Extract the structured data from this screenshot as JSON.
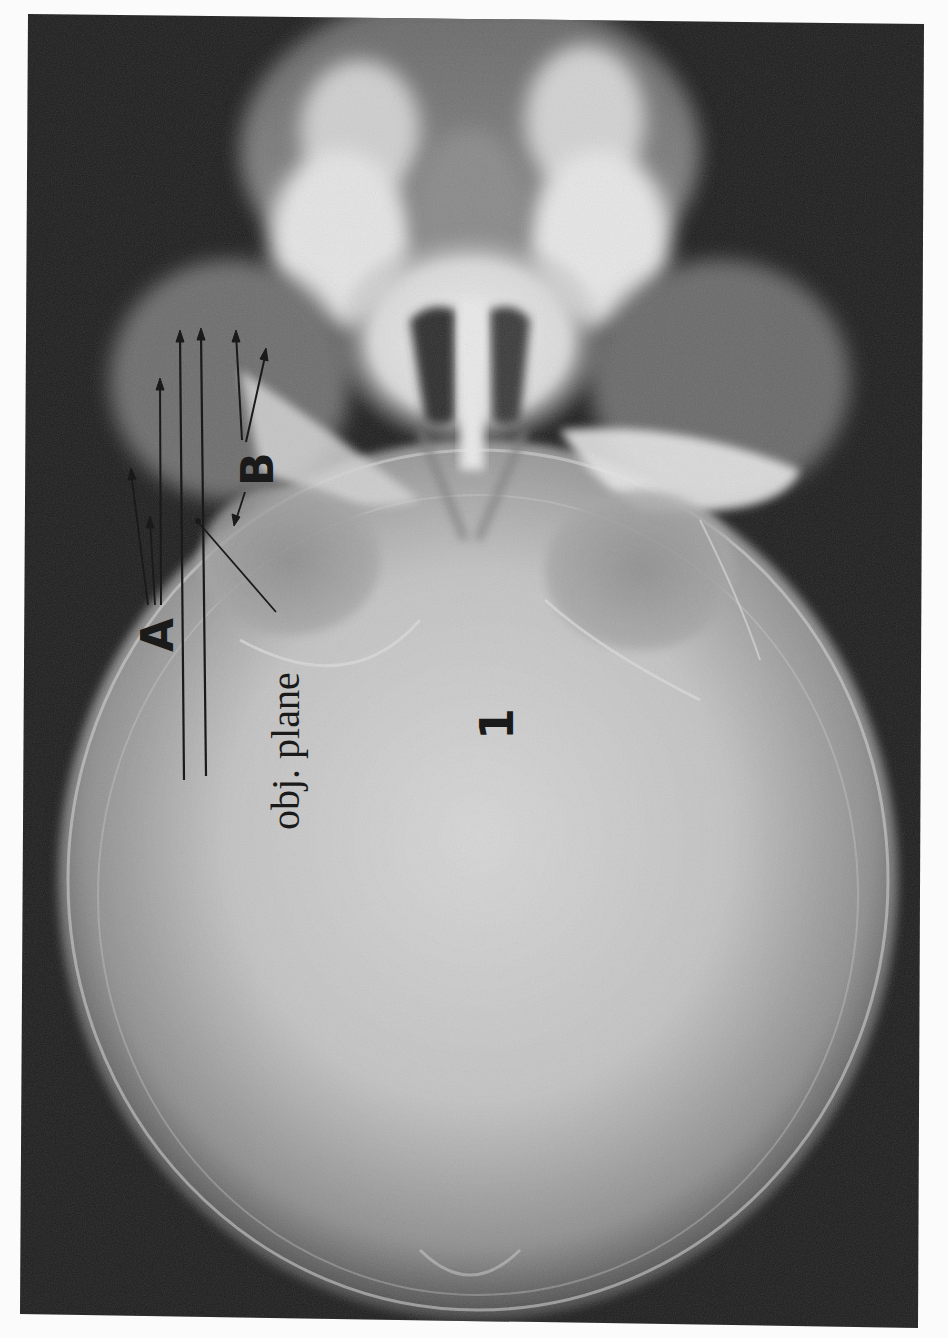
{
  "figure": {
    "kind": "radiograph",
    "orientation": "rotated 90 degrees counter-clockwise",
    "colors": {
      "page_background": "#fbfbfb",
      "film_dark": "#1c1c1c",
      "bone_light": "#e2e2e2",
      "skull_mid": "#b9b9b9",
      "annotation_ink": "#1a1a1a"
    },
    "annotations": {
      "label_a": "A",
      "label_b": "B",
      "label_obj_plane": "obj. plane",
      "label_number": "1"
    }
  }
}
